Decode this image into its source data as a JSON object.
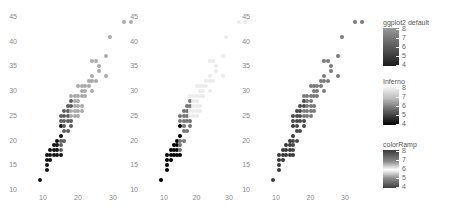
{
  "chart_data": [
    {
      "type": "scatter",
      "title": "",
      "panel": "ggplot2 default",
      "xlabel": "",
      "ylabel": "",
      "xlim": [
        8,
        36
      ],
      "ylim": [
        10,
        46
      ],
      "xticks": [
        "10",
        "20",
        "30"
      ],
      "yticks": [
        "10",
        "15",
        "20",
        "25",
        "30",
        "35",
        "40",
        "45"
      ],
      "color_variable_range": [
        4,
        8
      ],
      "legend": {
        "title": "ggplot2 default",
        "ticks": [
          "8",
          "7",
          "6",
          "5",
          "4"
        ],
        "scale": "gray (light=low, dark=high)"
      }
    },
    {
      "type": "scatter",
      "panel": "Inferno",
      "xlim": [
        8,
        36
      ],
      "ylim": [
        10,
        46
      ],
      "xticks": [
        "10",
        "20",
        "30"
      ],
      "yticks": [
        "10",
        "15",
        "20",
        "25",
        "30",
        "35",
        "40",
        "45"
      ],
      "legend": {
        "title": "Inferno",
        "ticks": [
          "8",
          "7",
          "6",
          "5",
          "4"
        ],
        "scale": "white to black"
      }
    },
    {
      "type": "scatter",
      "panel": "colorRamp",
      "xlim": [
        8,
        36
      ],
      "ylim": [
        10,
        46
      ],
      "xticks": [
        "10",
        "20",
        "30"
      ],
      "yticks": [
        "10",
        "15",
        "20",
        "25",
        "30",
        "35",
        "40",
        "45"
      ],
      "legend": {
        "title": "colorRamp",
        "ticks": [
          "8",
          "7",
          "6",
          "5",
          "4"
        ],
        "scale": "diverging gray, light in middle"
      }
    }
  ],
  "points": [
    [
      9,
      12,
      8
    ],
    [
      11,
      14,
      8
    ],
    [
      11,
      15,
      8
    ],
    [
      11,
      16,
      8
    ],
    [
      12,
      16,
      8
    ],
    [
      11,
      17,
      8
    ],
    [
      12,
      17,
      8
    ],
    [
      13,
      17,
      8
    ],
    [
      14,
      17,
      8
    ],
    [
      15,
      17,
      8
    ],
    [
      12,
      18,
      8
    ],
    [
      13,
      18,
      8
    ],
    [
      14,
      18,
      8
    ],
    [
      15,
      18,
      6
    ],
    [
      13,
      19,
      8
    ],
    [
      14,
      19,
      8
    ],
    [
      15,
      19,
      6
    ],
    [
      14,
      20,
      8
    ],
    [
      15,
      20,
      6
    ],
    [
      16,
      20,
      6
    ],
    [
      15,
      21,
      8
    ],
    [
      16,
      22,
      6
    ],
    [
      17,
      22,
      6
    ],
    [
      15,
      23,
      8
    ],
    [
      16,
      23,
      6
    ],
    [
      18,
      23,
      6
    ],
    [
      15,
      24,
      6
    ],
    [
      16,
      24,
      6
    ],
    [
      17,
      24,
      6
    ],
    [
      18,
      24,
      6
    ],
    [
      15,
      25,
      6
    ],
    [
      16,
      25,
      6
    ],
    [
      17,
      25,
      6
    ],
    [
      18,
      25,
      4
    ],
    [
      19,
      25,
      4
    ],
    [
      20,
      25,
      4
    ],
    [
      16,
      26,
      6
    ],
    [
      17,
      26,
      6
    ],
    [
      18,
      26,
      4
    ],
    [
      19,
      26,
      4
    ],
    [
      20,
      26,
      4
    ],
    [
      21,
      26,
      4
    ],
    [
      17,
      27,
      6
    ],
    [
      18,
      27,
      6
    ],
    [
      19,
      27,
      4
    ],
    [
      20,
      27,
      4
    ],
    [
      21,
      27,
      4
    ],
    [
      18,
      28,
      6
    ],
    [
      19,
      28,
      4
    ],
    [
      20,
      28,
      4
    ],
    [
      18,
      29,
      4
    ],
    [
      19,
      29,
      4
    ],
    [
      20,
      29,
      4
    ],
    [
      21,
      29,
      4
    ],
    [
      22,
      29,
      4
    ],
    [
      21,
      30,
      4
    ],
    [
      22,
      30,
      4
    ],
    [
      24,
      30,
      4
    ],
    [
      20,
      31,
      4
    ],
    [
      21,
      31,
      4
    ],
    [
      22,
      31,
      4
    ],
    [
      23,
      31,
      4
    ],
    [
      23,
      32,
      4
    ],
    [
      24,
      32,
      4
    ],
    [
      25,
      32,
      4
    ],
    [
      24,
      33,
      4
    ],
    [
      28,
      33,
      4
    ],
    [
      26,
      34,
      4
    ],
    [
      26,
      35,
      4
    ],
    [
      24,
      36,
      4
    ],
    [
      25,
      36,
      4
    ],
    [
      28,
      37,
      4
    ],
    [
      29,
      41,
      4
    ],
    [
      33,
      44,
      4
    ],
    [
      35,
      44,
      4
    ]
  ],
  "panels": [
    {
      "name": "ggplot2 default",
      "x0": 43,
      "xscale": 3.5
    },
    {
      "name": "Inferno",
      "x0": 164,
      "xscale": 3.25
    },
    {
      "name": "colorRamp",
      "x0": 276,
      "xscale": 3.45
    }
  ],
  "legends": [
    {
      "title": "ggplot2 default",
      "ticks": [
        "8",
        "7",
        "6",
        "5",
        "4"
      ],
      "gradient": "linear-gradient(to bottom,#9a9a9a,#1a1a1a)"
    },
    {
      "title": "Inferno",
      "ticks": [
        "8",
        "7",
        "6",
        "5",
        "4"
      ],
      "gradient": "linear-gradient(to bottom,#f4f4f4,#bdbdbd 30%,#5a5a5a 65%,#000000)"
    },
    {
      "title": "colorRamp",
      "ticks": [
        "8",
        "7",
        "6",
        "5",
        "4"
      ],
      "gradient": "linear-gradient(to bottom,#3a3a3a,#8a8a8a 30%,#ffffff 52%,#8a8a8a 75%,#3f3f3f)"
    }
  ]
}
